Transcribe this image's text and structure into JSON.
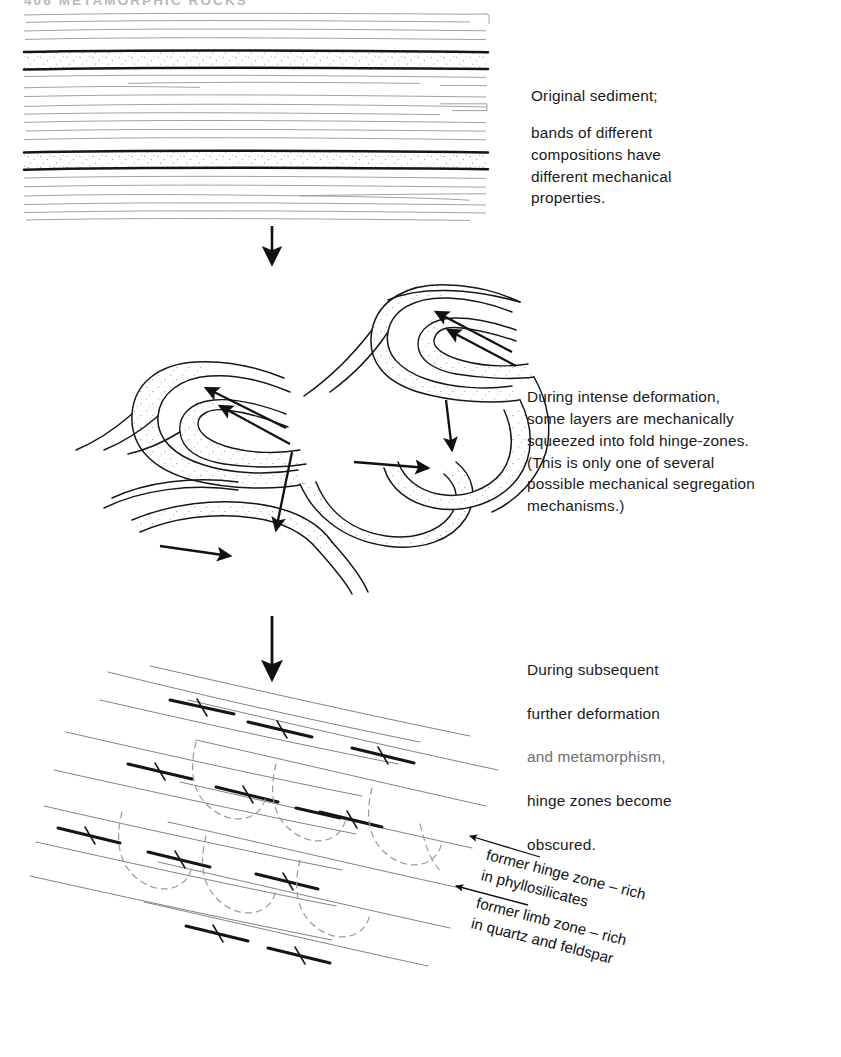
{
  "page": {
    "running_head": "406   METAMORPHIC ROCKS",
    "width": 841,
    "height": 1057,
    "background": "#ffffff",
    "ink": "#111111"
  },
  "captions": {
    "stage1": {
      "lead": "Original sediment;",
      "body": "bands of different\ncompositions have\ndifferent mechanical\nproperties."
    },
    "stage2": {
      "body": "During intense deformation,\nsome layers are mechanically\nsqueezed into fold hinge-zones.\n(This is only one of several\npossible mechanical segregation\nmechanisms.)"
    },
    "stage3": {
      "line1": "During subsequent",
      "line2": "further deformation",
      "line3": "and metamorphism,",
      "line4": "hinge zones become",
      "line5": "obscured."
    }
  },
  "leader_labels": {
    "hinge": "former hinge zone – rich\nin phyllosilicates",
    "limb": "former limb zone – rich\nin quartz and feldspar"
  },
  "diagram": {
    "stage1_name": "undeformed bedded sediment",
    "stage2_name": "isoclinal folds with hinge thickening",
    "stage3_name": "transposed foliation with ghost hinges",
    "transition_arrow_count": 2,
    "flow_arrow_count": 8,
    "leader_arrow_count": 2,
    "stipple_fill": "#d8d8d8",
    "thick_band_color": "#1a1a1a",
    "thin_line_color": "#4a4a4a",
    "dashed_ghost_color": "#8c8c8c"
  }
}
